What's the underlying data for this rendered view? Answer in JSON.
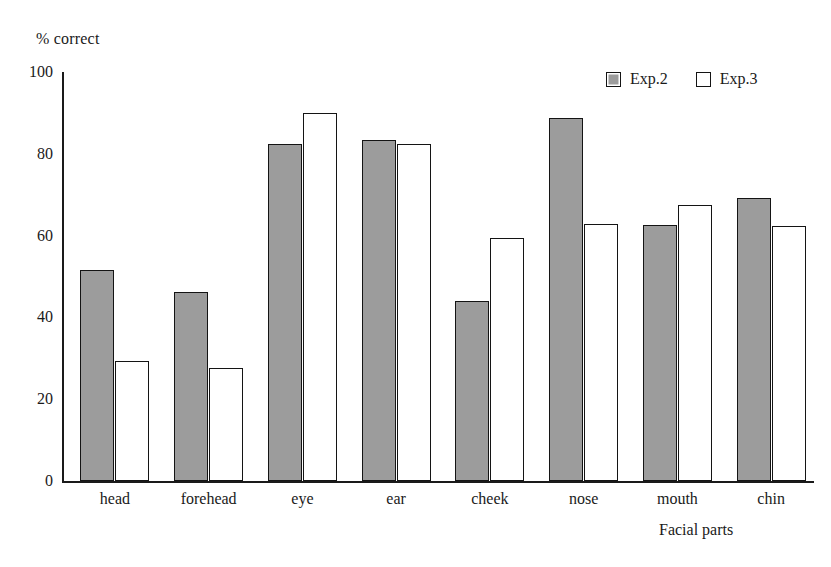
{
  "chart_data": {
    "type": "bar",
    "title": "",
    "xlabel": "Facial parts",
    "ylabel": "% correct",
    "ylim": [
      0,
      100
    ],
    "yticks": [
      0,
      20,
      40,
      60,
      80,
      100
    ],
    "grid": false,
    "legend_position": "top-right",
    "categories": [
      "head",
      "forehead",
      "eye",
      "ear",
      "cheek",
      "nose",
      "mouth",
      "chin"
    ],
    "series": [
      {
        "name": "Exp.2",
        "color": "#9c9c9c",
        "values": [
          51.5,
          46.3,
          82.5,
          83.3,
          44.0,
          88.7,
          62.5,
          69.3
        ]
      },
      {
        "name": "Exp.3",
        "color": "#ffffff",
        "values": [
          29.3,
          27.7,
          90.1,
          82.3,
          59.4,
          62.8,
          67.4,
          62.3
        ]
      }
    ]
  },
  "legend": {
    "items": [
      {
        "label": "Exp.2",
        "swatch": "filled-gray-square-icon"
      },
      {
        "label": "Exp.3",
        "swatch": "outlined-white-square-icon"
      }
    ]
  }
}
